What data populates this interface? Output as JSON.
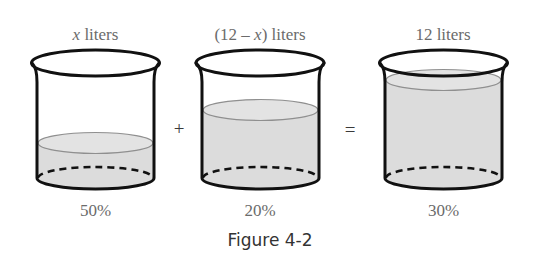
{
  "figure": {
    "caption": "Figure 4-2",
    "beakers": [
      {
        "id": "beaker-1",
        "volume_label_pre": "",
        "volume_label_var": "x",
        "volume_label_post": " liters",
        "concentration": "50%",
        "fill_level": "low"
      },
      {
        "id": "beaker-2",
        "volume_label_pre": "(12 – ",
        "volume_label_var": "x",
        "volume_label_post": ") liters",
        "concentration": "20%",
        "fill_level": "medium"
      },
      {
        "id": "beaker-3",
        "volume_label_pre": "12 liters",
        "volume_label_var": "",
        "volume_label_post": "",
        "concentration": "30%",
        "fill_level": "high"
      }
    ],
    "operators": {
      "plus": "+",
      "equals": "="
    },
    "colors": {
      "outline": "#111111",
      "liquid": "#dcdcdc",
      "label": "#6b6b6b"
    }
  }
}
